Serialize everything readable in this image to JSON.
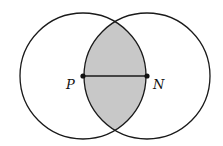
{
  "diagram": {
    "type": "two-circle-intersection",
    "points": [
      {
        "label": "P",
        "x": 83,
        "y": 76
      },
      {
        "label": "N",
        "x": 147,
        "y": 76
      }
    ],
    "radius": 63,
    "segment": "PN",
    "shaded_region": "lens intersection of circles centered at P and N",
    "colors": {
      "stroke": "#1a1a1a",
      "shade": "#c8c8c8",
      "background": "#ffffff"
    }
  }
}
